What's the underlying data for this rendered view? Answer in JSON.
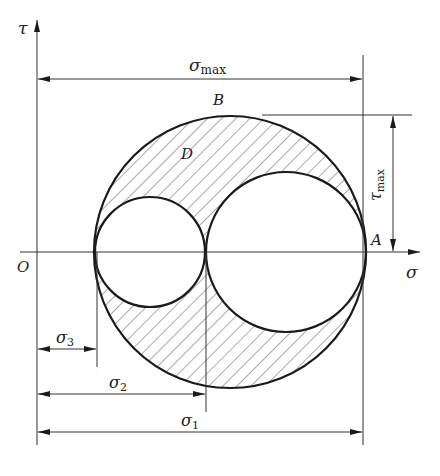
{
  "figure": {
    "type": "mohr-circle-diagram",
    "colors": {
      "line": "#1a1a1a",
      "background": "#ffffff"
    }
  },
  "axes": {
    "x_label": "σ",
    "y_label": "τ",
    "origin_label": "O"
  },
  "points": {
    "A": "A",
    "B": "B",
    "D": "D"
  },
  "dimensions": {
    "sigma_max": {
      "base": "σ",
      "sub": "max"
    },
    "tau_max": {
      "base": "τ",
      "sub": "max"
    },
    "sigma_1": {
      "base": "σ",
      "sub": "1"
    },
    "sigma_2": {
      "base": "σ",
      "sub": "2"
    },
    "sigma_3": {
      "base": "σ",
      "sub": "3"
    }
  },
  "circles": [
    {
      "name": "outer-circle",
      "spans": "σ3 to σ1"
    },
    {
      "name": "left-circle",
      "spans": "σ3 to σ2"
    },
    {
      "name": "right-circle",
      "spans": "σ2 to σ1"
    }
  ]
}
